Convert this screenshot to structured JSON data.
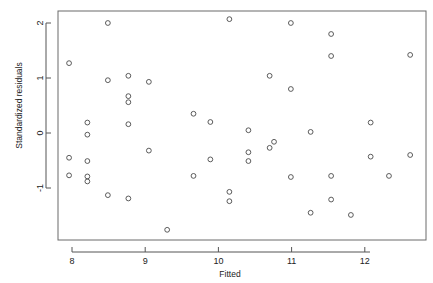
{
  "chart_data": {
    "type": "scatter",
    "title": "",
    "xlabel": "Fitted",
    "ylabel": "Standardized residuals",
    "xlim": [
      7.79,
      12.74
    ],
    "ylim": [
      -1.78,
      2.23
    ],
    "xticks": [
      8,
      9,
      10,
      11,
      12
    ],
    "xticklabels": [
      "8",
      "9",
      "10",
      "11",
      "12"
    ],
    "yticks": [
      2,
      1,
      0,
      -1
    ],
    "yticklabels": [
      "2",
      "1",
      "0",
      "-1"
    ],
    "grid": false,
    "legend": null,
    "marker": "open-circle",
    "point_count": 55,
    "points": [
      {
        "x": 7.96,
        "y": 1.27
      },
      {
        "x": 7.96,
        "y": -0.45
      },
      {
        "x": 7.96,
        "y": -0.77
      },
      {
        "x": 8.21,
        "y": 0.19
      },
      {
        "x": 8.21,
        "y": -0.03
      },
      {
        "x": 8.21,
        "y": -0.51
      },
      {
        "x": 8.21,
        "y": -0.79
      },
      {
        "x": 8.21,
        "y": -0.88
      },
      {
        "x": 8.49,
        "y": 2.0
      },
      {
        "x": 8.49,
        "y": 0.96
      },
      {
        "x": 8.49,
        "y": -1.13
      },
      {
        "x": 8.77,
        "y": 1.04
      },
      {
        "x": 8.77,
        "y": 0.67
      },
      {
        "x": 8.77,
        "y": 0.56
      },
      {
        "x": 8.77,
        "y": 0.16
      },
      {
        "x": 8.77,
        "y": -1.19
      },
      {
        "x": 9.05,
        "y": 0.93
      },
      {
        "x": 9.05,
        "y": -0.32
      },
      {
        "x": 9.3,
        "y": -1.76
      },
      {
        "x": 9.66,
        "y": 0.35
      },
      {
        "x": 9.66,
        "y": -0.78
      },
      {
        "x": 9.89,
        "y": 0.2
      },
      {
        "x": 9.89,
        "y": -0.48
      },
      {
        "x": 10.15,
        "y": 2.07
      },
      {
        "x": 10.15,
        "y": -1.07
      },
      {
        "x": 10.15,
        "y": -1.24
      },
      {
        "x": 10.41,
        "y": 0.05
      },
      {
        "x": 10.41,
        "y": -0.35
      },
      {
        "x": 10.41,
        "y": -0.51
      },
      {
        "x": 10.7,
        "y": 1.04
      },
      {
        "x": 10.7,
        "y": -0.27
      },
      {
        "x": 10.76,
        "y": -0.16
      },
      {
        "x": 10.99,
        "y": 2.0
      },
      {
        "x": 10.99,
        "y": 0.8
      },
      {
        "x": 10.99,
        "y": -0.8
      },
      {
        "x": 11.26,
        "y": 0.02
      },
      {
        "x": 11.26,
        "y": -1.45
      },
      {
        "x": 11.54,
        "y": 1.8
      },
      {
        "x": 11.54,
        "y": 1.4
      },
      {
        "x": 11.54,
        "y": -0.78
      },
      {
        "x": 11.54,
        "y": -1.21
      },
      {
        "x": 11.81,
        "y": -1.49
      },
      {
        "x": 12.08,
        "y": 0.19
      },
      {
        "x": 12.08,
        "y": -0.43
      },
      {
        "x": 12.33,
        "y": -0.78
      },
      {
        "x": 12.62,
        "y": 1.42
      },
      {
        "x": 12.62,
        "y": -0.4
      }
    ]
  },
  "axes": {
    "x_title": "Fitted",
    "y_title": "Standardized residuals"
  }
}
